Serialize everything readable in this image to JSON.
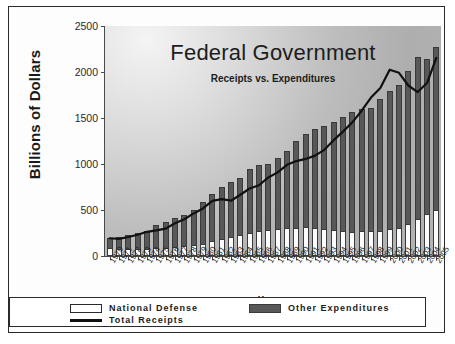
{
  "chart_data": {
    "type": "bar",
    "title": "Federal Government",
    "subtitle": "Receipts vs. Expenditures",
    "xlabel": "Year",
    "ylabel": "Billions of Dollars",
    "ylim": [
      0,
      2500
    ],
    "yticks": [
      0,
      500,
      1000,
      1500,
      2000,
      2500
    ],
    "grid": false,
    "legend_position": "bottom",
    "stacked": true,
    "categories": [
      "1970",
      "1971",
      "1972",
      "1973",
      "1974",
      "1975",
      "1976",
      "1977",
      "1978",
      "1979",
      "1980",
      "1981",
      "1982",
      "1983",
      "1984",
      "1985",
      "1986",
      "1987",
      "1988",
      "1989",
      "1990",
      "1991",
      "1992",
      "1993",
      "1994",
      "1995",
      "1996",
      "1997",
      "1998",
      "1999",
      "2000",
      "2001",
      "2002",
      "2003",
      "2004",
      "2005"
    ],
    "series": [
      {
        "name": "National Defense",
        "color": "#fcfcfc",
        "values": [
          82,
          79,
          79,
          77,
          80,
          87,
          90,
          97,
          105,
          117,
          134,
          158,
          186,
          210,
          228,
          253,
          273,
          282,
          290,
          304,
          300,
          320,
          303,
          292,
          282,
          273,
          266,
          271,
          269,
          275,
          295,
          306,
          349,
          405,
          456,
          495
        ]
      },
      {
        "name": "Other Expenditures",
        "color": "#585858",
        "values": [
          114,
          132,
          153,
          169,
          189,
          245,
          282,
          312,
          346,
          386,
          457,
          520,
          560,
          598,
          623,
          693,
          717,
          720,
          774,
          839,
          952,
          1004,
          1078,
          1117,
          1180,
          1242,
          1294,
          1330,
          1343,
          1427,
          1495,
          1557,
          1662,
          1755,
          1685,
          1777
        ]
      }
    ],
    "line_series": {
      "name": "Total Receipts",
      "color": "#111111",
      "values": [
        193,
        187,
        207,
        231,
        263,
        279,
        298,
        356,
        400,
        463,
        517,
        599,
        618,
        601,
        666,
        734,
        769,
        854,
        909,
        991,
        1032,
        1055,
        1091,
        1154,
        1259,
        1352,
        1453,
        1579,
        1722,
        1827,
        2025,
        1991,
        1853,
        1782,
        1880,
        2154
      ]
    }
  },
  "axis": {
    "y_tick_labels": [
      "2500",
      "2000",
      "1500",
      "1000",
      "500",
      "0"
    ],
    "y_axis_title": "Billions of Dollars",
    "x_axis_title": "Year"
  },
  "legend": {
    "items": [
      {
        "label": "National Defense",
        "swatch": "white-rect-swatch"
      },
      {
        "label": "Other Expenditures",
        "swatch": "dark-rect-swatch"
      },
      {
        "label": "Total Receipts",
        "swatch": "black-line-swatch"
      }
    ]
  }
}
